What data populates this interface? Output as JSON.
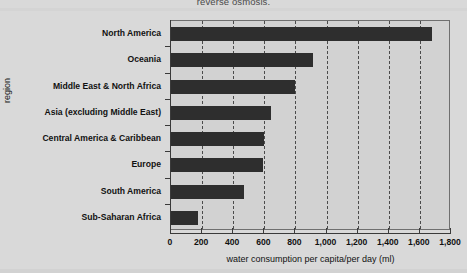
{
  "caption_fragment": "reverse osmosis.",
  "colors": {
    "bar": "#2e2e2e",
    "plot_background": "#d2d2d2",
    "page_background": "#d9d9d9",
    "axis": "#3a3a3a",
    "gridline": "#4b4b4b",
    "text": "#111111"
  },
  "chart_data": {
    "type": "bar",
    "orientation": "horizontal",
    "title": "",
    "xlabel": "water consumption per capita/per day (ml)",
    "ylabel": "region",
    "categories": [
      "North America",
      "Oceania",
      "Middle East & North Africa",
      "Asia (excluding Middle East)",
      "Central America & Caribbean",
      "Europe",
      "South America",
      "Sub-Saharan Africa"
    ],
    "values": [
      1680,
      910,
      800,
      640,
      600,
      590,
      470,
      175
    ],
    "xlim": [
      0,
      1800
    ],
    "xticks": [
      0,
      200,
      400,
      600,
      800,
      1000,
      1200,
      1400,
      1600,
      1800
    ],
    "xtick_labels": [
      "0",
      "200",
      "400",
      "600",
      "800",
      "1,000",
      "1,200",
      "1,400",
      "1,600",
      "1,800"
    ],
    "grid": true,
    "grid_axis": "x",
    "grid_style": "dashed",
    "legend": false,
    "series": [
      {
        "name": "water consumption per capita/per day (ml)",
        "values": [
          1680,
          910,
          800,
          640,
          600,
          590,
          470,
          175
        ]
      }
    ]
  }
}
